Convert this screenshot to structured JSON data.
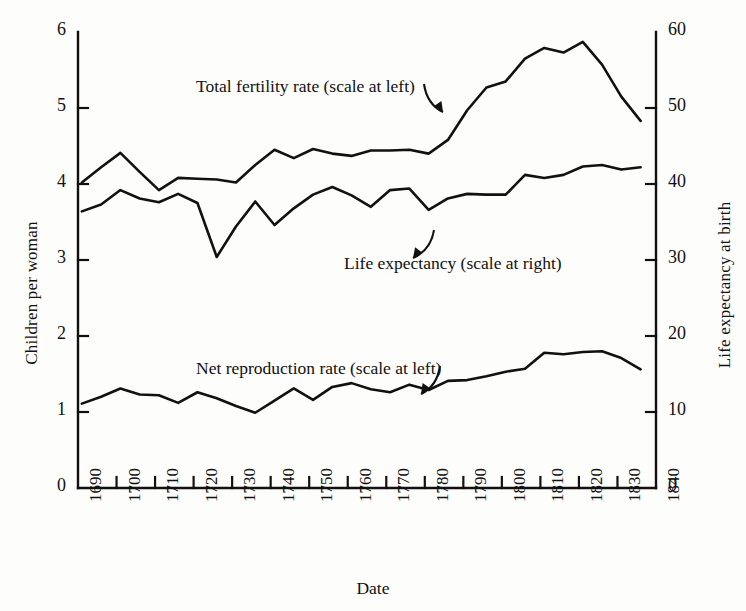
{
  "chart_data": {
    "type": "line",
    "title": "",
    "xlabel": "Date",
    "ylabel": "Children per woman",
    "y2label": "Life expectancy at birth",
    "xlim": [
      1690,
      1840
    ],
    "ylim": [
      0,
      6
    ],
    "y2lim": [
      0,
      60
    ],
    "grid": false,
    "legend": "in-plot annotations with arrows",
    "xticks": [
      "1690",
      "1700",
      "1710",
      "1720",
      "1730",
      "1740",
      "1750",
      "1760",
      "1770",
      "1780",
      "1790",
      "1800",
      "1810",
      "1820",
      "1830",
      "1840"
    ],
    "xtick_values": [
      1690,
      1700,
      1710,
      1720,
      1730,
      1740,
      1750,
      1760,
      1770,
      1780,
      1790,
      1800,
      1810,
      1820,
      1830,
      1840
    ],
    "yticks_left": [
      "0",
      "1",
      "2",
      "3",
      "4",
      "5",
      "6"
    ],
    "ytick_values_left": [
      0,
      1,
      2,
      3,
      4,
      5,
      6
    ],
    "yticks_right": [
      "0",
      "10",
      "20",
      "30",
      "40",
      "50",
      "60"
    ],
    "ytick_values_right": [
      0,
      10,
      20,
      30,
      40,
      50,
      60
    ],
    "x": [
      1691,
      1696,
      1701,
      1706,
      1711,
      1716,
      1721,
      1726,
      1731,
      1736,
      1741,
      1746,
      1751,
      1756,
      1761,
      1766,
      1771,
      1776,
      1781,
      1786,
      1791,
      1796,
      1801,
      1806,
      1811,
      1816,
      1821,
      1826,
      1831,
      1836
    ],
    "series": [
      {
        "name": "Total fertility rate (scale at left)",
        "axis": "left",
        "units": "children per woman",
        "values": [
          4.02,
          4.22,
          4.41,
          4.16,
          3.92,
          4.08,
          4.07,
          4.06,
          4.02,
          4.25,
          4.45,
          4.34,
          4.46,
          4.4,
          4.37,
          4.44,
          4.44,
          4.45,
          4.4,
          4.58,
          4.97,
          5.27,
          5.35,
          5.65,
          5.79,
          5.73,
          5.87,
          5.57,
          5.15,
          4.83
        ]
      },
      {
        "name": "Life expectancy (scale at right)",
        "axis": "right",
        "units": "years",
        "values": [
          36.4,
          37.3,
          39.2,
          38.1,
          37.6,
          38.7,
          37.5,
          30.4,
          34.4,
          37.7,
          34.6,
          36.8,
          38.6,
          39.6,
          38.5,
          37.0,
          39.2,
          39.4,
          36.6,
          38.1,
          38.7,
          38.6,
          38.6,
          41.2,
          40.8,
          41.2,
          42.3,
          42.5,
          41.9,
          42.2
        ]
      },
      {
        "name": "Net reproduction rate (scale at left)",
        "axis": "left",
        "units": "daughters per woman",
        "values": [
          1.11,
          1.2,
          1.31,
          1.23,
          1.22,
          1.12,
          1.26,
          1.18,
          1.08,
          0.99,
          1.15,
          1.31,
          1.16,
          1.33,
          1.38,
          1.3,
          1.26,
          1.36,
          1.29,
          1.41,
          1.42,
          1.47,
          1.53,
          1.57,
          1.78,
          1.76,
          1.79,
          1.8,
          1.71,
          1.56
        ]
      }
    ],
    "annotations": [
      {
        "name": "total-fertility-rate-label",
        "text": "Total fertility rate (scale at left)",
        "x_px": 196,
        "y_px": 76,
        "arrow_from": [
          424,
          84
        ],
        "arrow_to": [
          443,
          112
        ]
      },
      {
        "name": "life-expectancy-label",
        "text": "Life expectancy (scale at right)",
        "x_px": 344,
        "y_px": 253,
        "arrow_from": [
          434,
          230
        ],
        "arrow_to": [
          413,
          258
        ]
      },
      {
        "name": "net-reproduction-rate-label",
        "text": "Net reproduction rate (scale at left)",
        "x_px": 196,
        "y_px": 358,
        "arrow_from": [
          440,
          366
        ],
        "arrow_to": [
          421,
          394
        ]
      }
    ]
  },
  "labels": {
    "ylabel_left": "Children per woman",
    "ylabel_right": "Life expectancy at birth",
    "xlabel": "Date"
  }
}
